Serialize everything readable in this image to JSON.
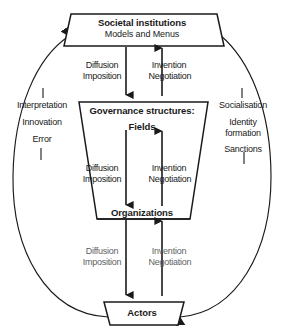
{
  "diagram": {
    "type": "cycle-diagram",
    "boxes": [
      {
        "id": "societal-institutions",
        "title": "Societal institutions",
        "subtitle": "Models and Menus",
        "shape": "trapezoid-wide-bottom"
      },
      {
        "id": "governance-structures",
        "title": "Governance structures:",
        "subtitle": "Fields",
        "shape": "inverted-trapezoid"
      },
      {
        "id": "organizations",
        "title": "Organizations",
        "subtitle": "",
        "shape": "trapezoid-base"
      },
      {
        "id": "actors",
        "title": "Actors",
        "subtitle": "",
        "shape": "trapezoid-wide-top"
      }
    ],
    "flow_groups": [
      {
        "id": "flow-top",
        "from": "societal-institutions",
        "to": "governance-structures",
        "down_line1": "Diffusion",
        "down_line2": "Imposition",
        "up_line1": "Invention",
        "up_line2": "Negotiation"
      },
      {
        "id": "flow-middle",
        "from": "governance-structures",
        "to": "organizations",
        "down_line1": "Diffusion",
        "down_line2": "Imposition",
        "up_line1": "Invention",
        "up_line2": "Negotiation"
      },
      {
        "id": "flow-bottom",
        "from": "organizations",
        "to": "actors",
        "down_line1": "Diffusion",
        "down_line2": "Imposition",
        "up_line1": "Invention",
        "up_line2": "Negotiation"
      }
    ],
    "side_labels": {
      "left": {
        "id": "upward-loop-label",
        "line1": "Interpretation",
        "line2": "Innovation",
        "line3": "Error"
      },
      "right": {
        "id": "downward-loop-label",
        "line1": "Socialisation",
        "line2": "Identity",
        "line3": "formation",
        "line4": "Sanctions"
      }
    },
    "colors": {
      "stroke": "#1a1a1a",
      "fill": "#ffffff",
      "text": "#1a1a1a",
      "faded_text": "#5f5f63",
      "background": "#ffffff"
    }
  }
}
